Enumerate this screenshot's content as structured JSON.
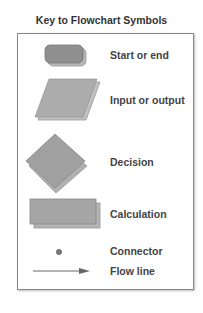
{
  "title": "Key to Flowchart Symbols",
  "colors": {
    "shape_fill": "#a6a6a6",
    "shape_dark": "#8a8a8a",
    "shadow": "#b8b8b8",
    "outline": "#7a7a7a",
    "text": "#444444"
  },
  "legend": [
    {
      "symbol": "rounded-rectangle",
      "label": "Start or end"
    },
    {
      "symbol": "parallelogram",
      "label": "Input or output"
    },
    {
      "symbol": "diamond",
      "label": "Decision"
    },
    {
      "symbol": "rectangle",
      "label": "Calculation"
    },
    {
      "symbol": "dot",
      "label": "Connector"
    },
    {
      "symbol": "arrow",
      "label": "Flow line"
    }
  ]
}
